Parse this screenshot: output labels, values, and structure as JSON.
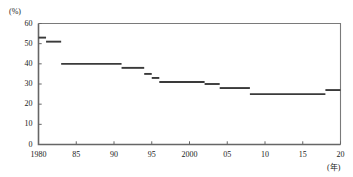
{
  "chart_data": {
    "type": "line",
    "subtype": "step",
    "title": "",
    "xlabel": "(年)",
    "ylabel": "(%)",
    "xlim": [
      1980,
      2020
    ],
    "ylim": [
      0,
      60
    ],
    "grid": false,
    "legend_position": "none",
    "y_ticks": [
      60,
      50,
      40,
      30,
      20,
      10,
      0
    ],
    "y_tick_labels": [
      "60",
      "50",
      "40",
      "30",
      "20",
      "10",
      "0"
    ],
    "x_ticks": [
      1980,
      1985,
      1990,
      1995,
      2000,
      2005,
      2010,
      2015,
      2020
    ],
    "x_tick_labels": [
      "1980",
      "85",
      "90",
      "95",
      "2000",
      "05",
      "10",
      "15",
      "20"
    ],
    "series_name": "",
    "line_color": "#3a3a3a",
    "frame_color": "#555555",
    "steps": [
      {
        "x_start": 1980,
        "x_end": 1981,
        "value": 53
      },
      {
        "x_start": 1981,
        "x_end": 1983,
        "value": 51
      },
      {
        "x_start": 1983,
        "x_end": 1991,
        "value": 40
      },
      {
        "x_start": 1991,
        "x_end": 1994,
        "value": 38
      },
      {
        "x_start": 1994,
        "x_end": 1995,
        "value": 35
      },
      {
        "x_start": 1995,
        "x_end": 1996,
        "value": 33
      },
      {
        "x_start": 1996,
        "x_end": 2002,
        "value": 31
      },
      {
        "x_start": 2002,
        "x_end": 2004,
        "value": 30
      },
      {
        "x_start": 2004,
        "x_end": 2008,
        "value": 28
      },
      {
        "x_start": 2008,
        "x_end": 2018,
        "value": 25
      },
      {
        "x_start": 2018,
        "x_end": 2020,
        "value": 27
      }
    ],
    "x_values": [
      1980,
      1981,
      1983,
      1991,
      1994,
      1995,
      1996,
      2002,
      2004,
      2008,
      2018,
      2020
    ],
    "y_values": [
      53,
      51,
      40,
      38,
      35,
      33,
      31,
      30,
      28,
      25,
      27,
      27
    ]
  }
}
